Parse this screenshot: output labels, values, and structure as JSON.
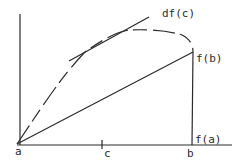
{
  "diagram": {
    "type": "mean-value-theorem-illustration",
    "labels": {
      "a": "a",
      "c": "c",
      "b": "b",
      "f_a": "f(a)",
      "f_b": "f(b)",
      "tangent": "df(c)"
    },
    "colors": {
      "stroke": "#2a2a2a",
      "background": "#ffffff"
    }
  }
}
